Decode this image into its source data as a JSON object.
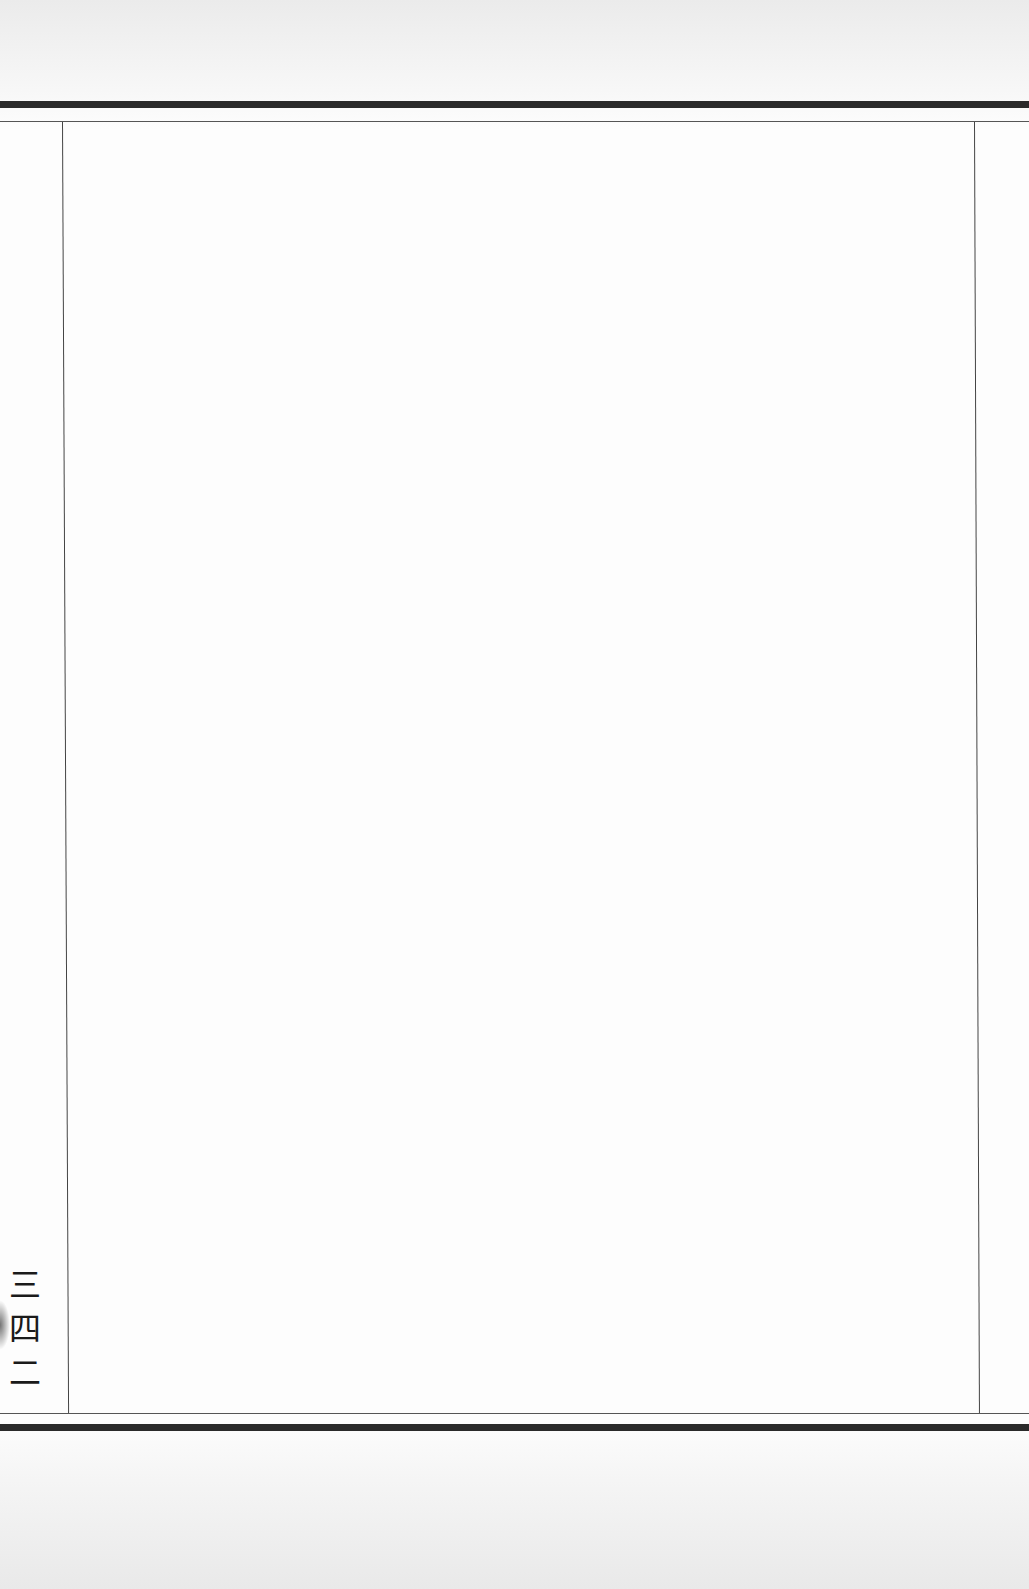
{
  "page": {
    "page_number": "三四二",
    "body_text": ""
  },
  "colors": {
    "paper": "#fdfdfd",
    "rule": "#2a2a2a",
    "text": "#1a1a1a"
  }
}
